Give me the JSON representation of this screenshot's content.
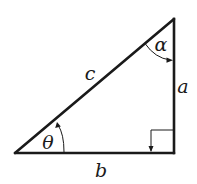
{
  "diagram": {
    "type": "right-triangle",
    "stroke_color": "#1a1a1a",
    "vertices": {
      "top": [
        174,
        19
      ],
      "bottom_left": [
        15,
        153
      ],
      "bottom_right": [
        174,
        153
      ]
    },
    "labels": {
      "hypotenuse": "c",
      "vertical_side": "a",
      "base": "b",
      "top_angle": "α",
      "bottom_left_angle": "θ"
    },
    "right_angle_marker": true
  }
}
